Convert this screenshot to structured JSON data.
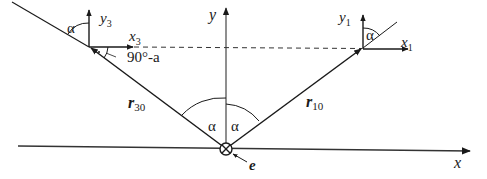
{
  "diagram": {
    "title": "",
    "colors": {
      "line": "#1a1a1a",
      "background": "#ffffff"
    },
    "axes": {
      "x_label": "x",
      "y_label": "y"
    },
    "frames": {
      "left": {
        "x_label": "x",
        "x_sub": "3",
        "y_label": "y",
        "y_sub": "3"
      },
      "right": {
        "x_label": "x",
        "x_sub": "1",
        "y_label": "y",
        "y_sub": "1"
      }
    },
    "vectors": {
      "left": {
        "label": "r",
        "sub": "30"
      },
      "right": {
        "label": "r",
        "sub": "10"
      }
    },
    "angles": {
      "alpha": "α",
      "left_frame_alpha": "α",
      "right_frame_alpha": "α",
      "center_left_alpha": "α",
      "center_right_alpha": "α",
      "complement": "90°-a"
    },
    "origin": {
      "symbol": "⊗",
      "label": "e"
    }
  }
}
